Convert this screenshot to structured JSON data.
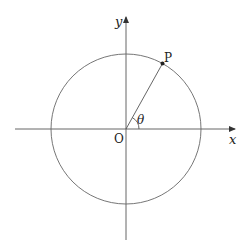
{
  "diagram": {
    "type": "unit-circle",
    "labels": {
      "x_axis": "x",
      "y_axis": "y",
      "origin": "O",
      "point": "P",
      "angle": "θ"
    },
    "colors": {
      "axis": "#444444",
      "circle": "#555555",
      "text": "#222222",
      "background": "#ffffff"
    }
  }
}
